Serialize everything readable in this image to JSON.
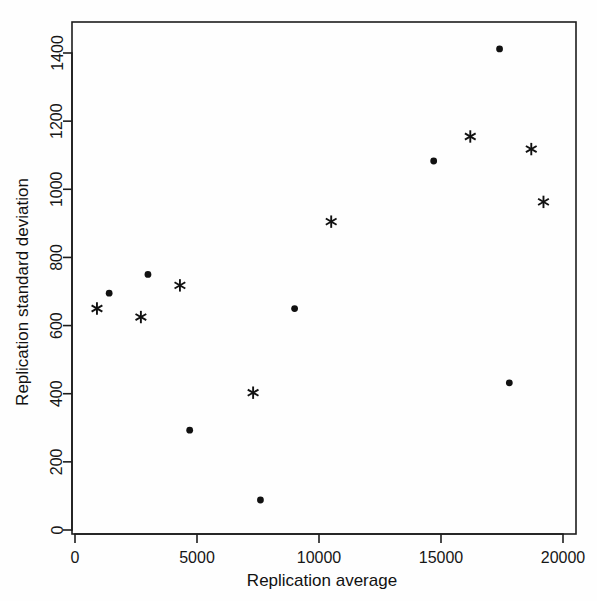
{
  "chart_data": {
    "type": "scatter",
    "title": "",
    "xlabel": "Replication average",
    "ylabel": "Replication standard deviation",
    "xlim": [
      0,
      20000
    ],
    "ylim": [
      0,
      1400
    ],
    "grid": false,
    "legend": "none",
    "xticks": [
      0,
      5000,
      10000,
      15000,
      20000
    ],
    "xtick_labels": [
      "0",
      "5000",
      "10000",
      "15000",
      "20000"
    ],
    "yticks": [
      0,
      200,
      400,
      600,
      800,
      1000,
      1200,
      1400
    ],
    "ytick_labels": [
      "0",
      "200",
      "400",
      "600",
      "800",
      "1000",
      "1200",
      "1400"
    ],
    "series": [
      {
        "name": "dot",
        "marker": "filled-circle",
        "color": "#111111",
        "points": [
          {
            "x": 1400,
            "y": 695
          },
          {
            "x": 2990,
            "y": 750
          },
          {
            "x": 4700,
            "y": 293
          },
          {
            "x": 7600,
            "y": 88
          },
          {
            "x": 9000,
            "y": 650
          },
          {
            "x": 14700,
            "y": 1083
          },
          {
            "x": 17400,
            "y": 1412
          },
          {
            "x": 17800,
            "y": 432
          }
        ]
      },
      {
        "name": "asterisk",
        "marker": "asterisk",
        "color": "#111111",
        "points": [
          {
            "x": 900,
            "y": 650
          },
          {
            "x": 2700,
            "y": 625
          },
          {
            "x": 4300,
            "y": 718
          },
          {
            "x": 7300,
            "y": 403
          },
          {
            "x": 10500,
            "y": 905
          },
          {
            "x": 16200,
            "y": 1155
          },
          {
            "x": 18700,
            "y": 1118
          },
          {
            "x": 19200,
            "y": 963
          }
        ]
      }
    ]
  },
  "axes": {
    "x_title": "Replication average",
    "y_title": "Replication standard deviation"
  }
}
